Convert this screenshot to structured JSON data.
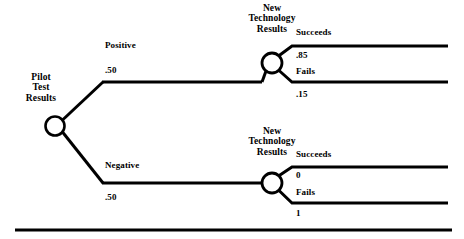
{
  "figure": {
    "type": "decision-tree",
    "background_color": "#ffffff",
    "stroke_color": "#000000"
  },
  "root_node": {
    "label_lines": [
      "Pilot",
      "Test",
      "Results"
    ],
    "label_line_1": "Pilot",
    "label_line_2": "Test",
    "label_line_3": "Results",
    "shape": "circle"
  },
  "branches": {
    "upper": {
      "label": "Positive",
      "probability": ".50"
    },
    "lower": {
      "label": "Negative",
      "probability": ".50"
    }
  },
  "chance_nodes": {
    "upper": {
      "label_line_1": "New",
      "label_line_2": "Technology",
      "label_line_3": "Results",
      "shape": "circle",
      "outcomes": [
        {
          "label": "Succeeds",
          "probability": ".85"
        },
        {
          "label": "Fails",
          "probability": ".15"
        }
      ]
    },
    "lower": {
      "label_line_1": "New",
      "label_line_2": "Technology",
      "label_line_3": "Results",
      "shape": "circle",
      "outcomes": [
        {
          "label": "Succeeds",
          "probability": "0"
        },
        {
          "label": "Fails",
          "probability": "1"
        }
      ]
    }
  }
}
